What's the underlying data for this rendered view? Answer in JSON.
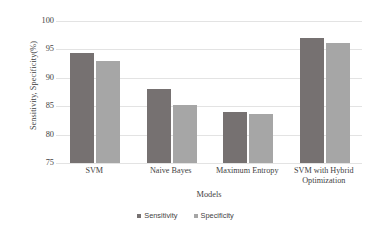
{
  "chart_data": {
    "type": "bar",
    "title": "",
    "xlabel": "Models",
    "ylabel": "Sensitivity, Specificity(%)",
    "categories": [
      "SVM",
      "Naive Bayes",
      "Maximum Entropy",
      "SVM with Hybrid Optimization"
    ],
    "series": [
      {
        "name": "Sensitivity",
        "color": "#767171",
        "values": [
          94.3,
          88.0,
          84.0,
          97.0
        ]
      },
      {
        "name": "Specificity",
        "color": "#a6a6a6",
        "values": [
          93.0,
          85.2,
          83.7,
          96.1
        ]
      }
    ],
    "ylim": [
      75,
      100
    ],
    "yticks": [
      75,
      80,
      85,
      90,
      95,
      100
    ],
    "ytick_labels": [
      "75",
      "80",
      "85",
      "90",
      "95",
      "100"
    ],
    "grid": true,
    "legend_position": "bottom"
  }
}
